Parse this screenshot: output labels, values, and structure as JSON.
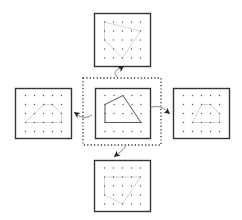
{
  "diagram": {
    "colors": {
      "frame": "#333333",
      "dot": "#555555",
      "polygon_main": "#444444",
      "polygon_faint": "#c8c8c8",
      "selection_border": "#333333",
      "arrow": "#777777",
      "arrowhead": "#222222"
    },
    "grid": {
      "cols": 5,
      "rows": 5,
      "spacing": 9
    },
    "selection": {
      "x": 83,
      "y": 78,
      "w": 78,
      "h": 67
    },
    "panels": [
      {
        "id": "center",
        "x": 95,
        "y": 88,
        "w": 55,
        "h": 50,
        "highlight": true,
        "polygon": [
          [
            0,
            1
          ],
          [
            2,
            0
          ],
          [
            4,
            3
          ],
          [
            0,
            3
          ]
        ]
      },
      {
        "id": "top",
        "x": 94,
        "y": 13,
        "w": 56,
        "h": 53,
        "highlight": false,
        "polygon": [
          [
            0,
            0
          ],
          [
            0,
            2
          ],
          [
            2,
            4
          ],
          [
            4,
            1
          ]
        ]
      },
      {
        "id": "left",
        "x": 15,
        "y": 88,
        "w": 56,
        "h": 50,
        "highlight": false,
        "polygon": [
          [
            0,
            3
          ],
          [
            2,
            1
          ],
          [
            3,
            1
          ],
          [
            4,
            2
          ],
          [
            4,
            3
          ]
        ]
      },
      {
        "id": "right",
        "x": 173,
        "y": 88,
        "w": 56,
        "h": 50,
        "highlight": false,
        "polygon": [
          [
            1,
            3
          ],
          [
            2,
            1
          ],
          [
            3,
            1
          ],
          [
            4,
            2
          ],
          [
            4,
            3
          ]
        ]
      },
      {
        "id": "bottom",
        "x": 94,
        "y": 160,
        "w": 56,
        "h": 51,
        "highlight": false,
        "polygon": [
          [
            0,
            1
          ],
          [
            4,
            1
          ],
          [
            2,
            4
          ],
          [
            0,
            3
          ]
        ]
      }
    ],
    "arrows": [
      {
        "id": "to-top",
        "path": "M118,78 C112,72 116,70 124,66",
        "head": [
          124,
          66
        ],
        "angle": -35
      },
      {
        "id": "to-left",
        "path": "M92,115 C86,119 80,118 74,112",
        "head": [
          74,
          112
        ],
        "angle": 215
      },
      {
        "id": "to-right",
        "path": "M150,108 C158,104 164,108 170,114",
        "head": [
          170,
          114
        ],
        "angle": 40
      },
      {
        "id": "to-bottom",
        "path": "M126,145 C124,150 120,152 114,157",
        "head": [
          114,
          157
        ],
        "angle": 140
      }
    ]
  }
}
